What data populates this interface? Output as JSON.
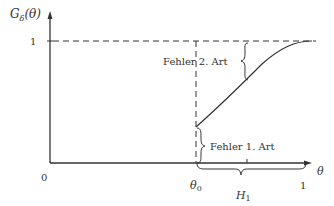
{
  "diagram": {
    "type": "power-function-plot",
    "y_axis_label": "G",
    "y_axis_label_sub": "δ",
    "y_axis_label_arg": "(θ)",
    "x_axis_label": "θ",
    "y_tick_1": "1",
    "origin_label": "0",
    "theta0_label": "θ",
    "theta0_sub": "0",
    "x_tick_1": "1",
    "h1_label": "H",
    "h1_sub": "1",
    "annotation_type2": "Fehler 2. Art",
    "annotation_type1": "Fehler 1. Art",
    "colors": {
      "line": "#333333",
      "background": "#ffffff"
    }
  }
}
